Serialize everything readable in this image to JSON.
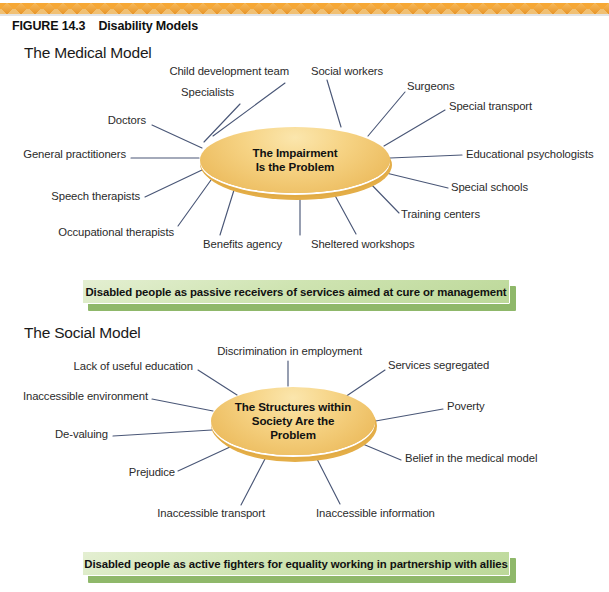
{
  "figure": {
    "number_label": "FIGURE 14.3",
    "title": "Disability Models"
  },
  "sections": {
    "medical": {
      "heading": "The Medical Model",
      "hub_line1": "The Impairment",
      "hub_line2": "Is the Problem",
      "spokes": [
        {
          "label": "Child development team",
          "side": "left"
        },
        {
          "label": "Specialists",
          "side": "left"
        },
        {
          "label": "Doctors",
          "side": "left"
        },
        {
          "label": "General practitioners",
          "side": "left"
        },
        {
          "label": "Speech therapists",
          "side": "left"
        },
        {
          "label": "Occupational therapists",
          "side": "left"
        },
        {
          "label": "Benefits agency",
          "side": "left"
        },
        {
          "label": "Sheltered workshops",
          "side": "right"
        },
        {
          "label": "Training centers",
          "side": "right"
        },
        {
          "label": "Special schools",
          "side": "right"
        },
        {
          "label": "Educational psychologists",
          "side": "right"
        },
        {
          "label": "Special transport",
          "side": "right"
        },
        {
          "label": "Surgeons",
          "side": "right"
        },
        {
          "label": "Social workers",
          "side": "right"
        }
      ],
      "banner": "Disabled people as passive receivers of services aimed at cure or management"
    },
    "social": {
      "heading": "The Social Model",
      "hub_line1": "The Structures within",
      "hub_line2": "Society Are the",
      "hub_line3": "Problem",
      "spokes": [
        {
          "label": "Discrimination in employment",
          "side": "left"
        },
        {
          "label": "Lack of useful education",
          "side": "left"
        },
        {
          "label": "Inaccessible environment",
          "side": "left"
        },
        {
          "label": "De-valuing",
          "side": "left"
        },
        {
          "label": "Prejudice",
          "side": "left"
        },
        {
          "label": "Inaccessible transport",
          "side": "left"
        },
        {
          "label": "Inaccessible information",
          "side": "right"
        },
        {
          "label": "Belief in the medical model",
          "side": "right"
        },
        {
          "label": "Poverty",
          "side": "right"
        },
        {
          "label": "Services segregated",
          "side": "right"
        }
      ],
      "banner": "Disabled people as active fighters for equality working in partnership with allies"
    }
  },
  "colors": {
    "band_orange": "#e8962a",
    "hub_gold": "#f0c467",
    "spoke_line": "#4a5777",
    "banner_green": "#cfe4b2",
    "banner_shadow_green": "#8fb86a"
  }
}
